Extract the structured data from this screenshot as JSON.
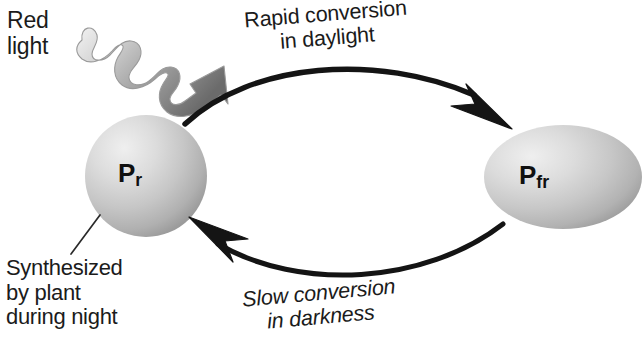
{
  "diagram": {
    "background_color": "#ffffff",
    "text_color": "#1b1b1b",
    "arrow_color": "#141414",
    "sphere_light": "#ececec",
    "sphere_mid": "#c9c9c9",
    "sphere_dark": "#9a9a9a",
    "light_arrow_light": "#e8e8e8",
    "light_arrow_dark": "#6e6e6e"
  },
  "labels": {
    "red_light": {
      "line1": "Red",
      "line2": "light"
    },
    "rapid_conversion": {
      "line1": "Rapid conversion",
      "line2": "in daylight"
    },
    "slow_conversion": {
      "line1": "Slow conversion",
      "line2": "in darkness"
    },
    "synthesized": {
      "line1": "Synthesized",
      "line2": "by plant",
      "line3": "during night"
    }
  },
  "forms": {
    "pr": {
      "symbol": "P",
      "subscript": "r",
      "full_label": "Pr"
    },
    "pfr": {
      "symbol": "P",
      "subscript": "fr",
      "full_label": "Pfr"
    }
  },
  "icons": {
    "light_wave": "wavy-light-arrow-icon",
    "top_arrow": "curved-arrow-right-icon",
    "bottom_arrow": "curved-arrow-left-icon",
    "leader": "leader-line-icon"
  }
}
